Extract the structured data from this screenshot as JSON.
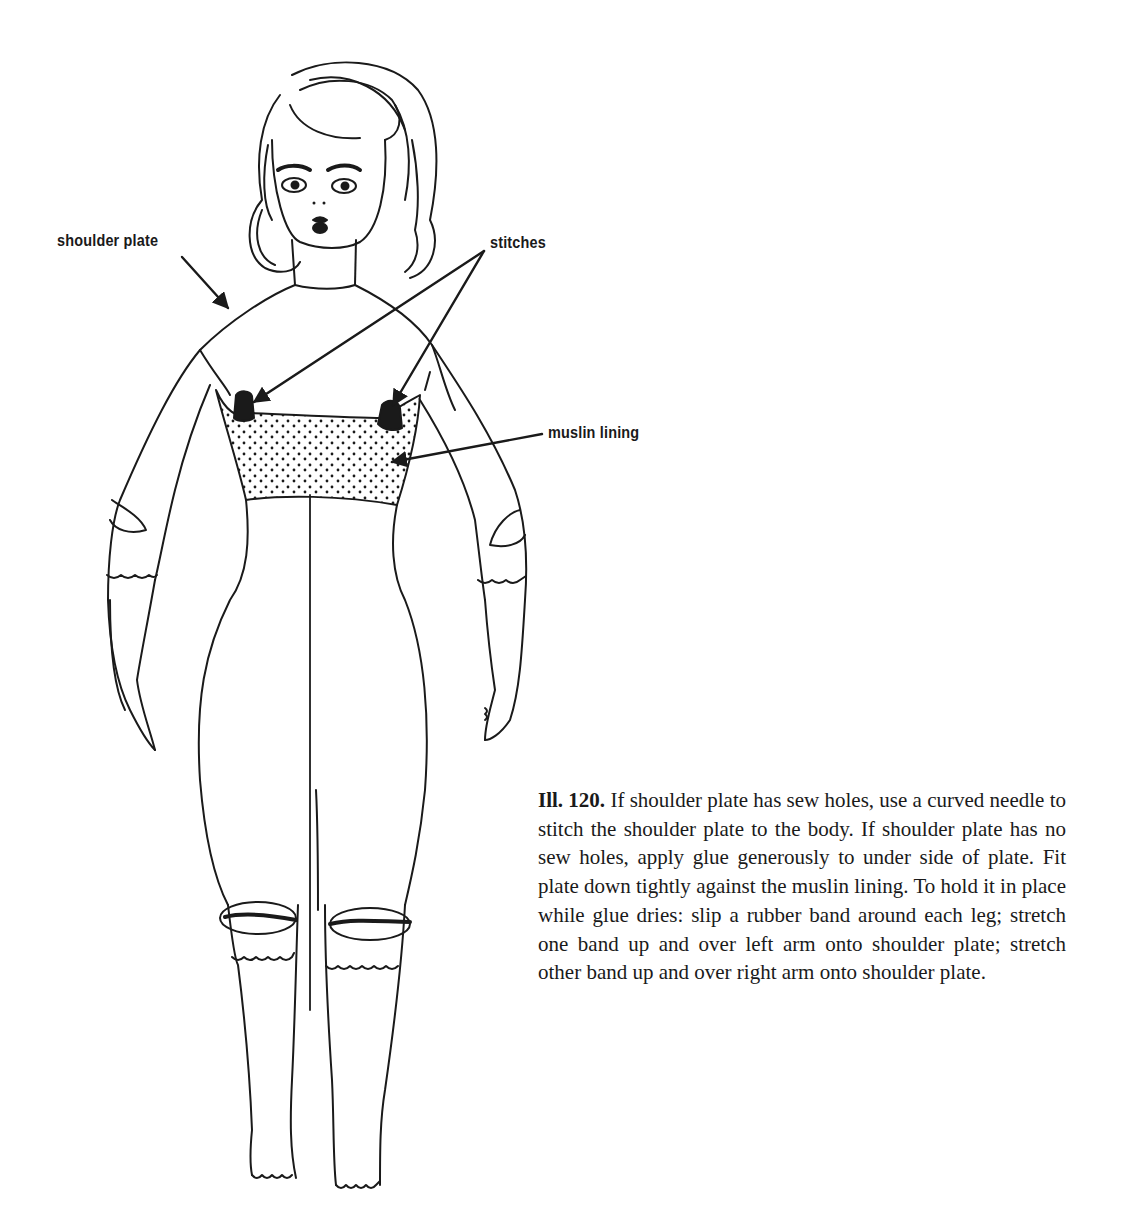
{
  "figure": {
    "labels": {
      "shoulder_plate": "shoulder plate",
      "stitches": "stitches",
      "muslin_lining": "muslin lining"
    }
  },
  "caption": {
    "number": "Ill. 120.",
    "text": "If shoulder plate has sew holes, use a curved needle to stitch the shoulder plate to the body. If shoulder plate has no sew holes, apply glue generously to under side of plate. Fit plate down tightly against the muslin lining. To hold it in place while glue dries: slip a rubber band around each leg; stretch one band up and over left arm onto shoulder plate; stretch other band up and over right arm onto shoulder plate."
  },
  "colors": {
    "ink": "#1a1a1a",
    "paper": "#ffffff"
  }
}
